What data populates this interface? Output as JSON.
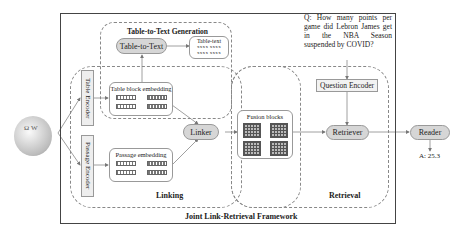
{
  "diagram": {
    "framework_label": "Joint Link-Retrieval Framework",
    "source_icon": "wikipedia-globe",
    "table_to_text": {
      "group_title": "Table-to-Text Generation",
      "module": "Table-to-Text",
      "output_box": {
        "title": "Table-text",
        "rows": [
          "xxxx  xxxx",
          "xxxx  xxxx"
        ]
      }
    },
    "linking": {
      "group_label": "Linking",
      "table_encoder": "Table Encoder",
      "passage_encoder": "Passage Encoder",
      "table_embedding": "Table block embedding",
      "passage_embedding": "Passage embedding",
      "linker": "Linker"
    },
    "fusion": {
      "label": "Fusion blocks"
    },
    "retrieval": {
      "group_label": "Retrieval",
      "question_encoder": "Question Encoder",
      "retriever": "Retriever"
    },
    "question": "Q: How many points per game did Lebron James get in the NBA Season suspended by COVID?",
    "reader": "Reader",
    "answer": "A: 25.3"
  }
}
